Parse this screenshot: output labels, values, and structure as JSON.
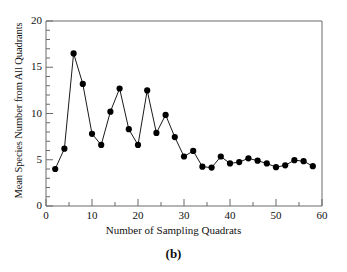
{
  "figure": {
    "panel_label": "(b)",
    "background_color": "#ffffff"
  },
  "chart_data": {
    "type": "line",
    "title": "",
    "subtitle": "",
    "xlabel": "Number of Sampling Quadrats",
    "ylabel": "Mean Species Number from All Quadrants",
    "xlim": [
      0,
      60
    ],
    "ylim": [
      0,
      20
    ],
    "x_major_ticks": [
      0,
      10,
      20,
      30,
      40,
      50,
      60
    ],
    "x_minor_tick_interval": 5,
    "y_major_ticks": [
      0,
      5,
      10,
      15,
      20
    ],
    "y_minor_tick_interval": 1,
    "x_tick_labels": [
      "0",
      "10",
      "20",
      "30",
      "40",
      "50",
      "60"
    ],
    "y_tick_labels": [
      "0",
      "5",
      "10",
      "15",
      "20"
    ],
    "grid": false,
    "legend": null,
    "marker": "filled-circle",
    "marker_color": "#000000",
    "line_color": "#000000",
    "axis_color": "#6b6b6b",
    "x": [
      2,
      4,
      6,
      8,
      10,
      12,
      14,
      16,
      18,
      20,
      22,
      24,
      26,
      28,
      30,
      32,
      34,
      36,
      38,
      40,
      42,
      44,
      46,
      48,
      50,
      52,
      54,
      56,
      58
    ],
    "values": [
      4.0,
      6.2,
      16.5,
      13.2,
      7.8,
      6.6,
      10.2,
      12.7,
      8.3,
      6.6,
      12.5,
      7.9,
      9.85,
      7.45,
      5.35,
      5.95,
      4.25,
      4.15,
      5.35,
      4.6,
      4.75,
      5.15,
      4.9,
      4.6,
      4.2,
      4.4,
      4.95,
      4.85,
      4.3
    ],
    "annotations": [
      "(b)"
    ]
  }
}
